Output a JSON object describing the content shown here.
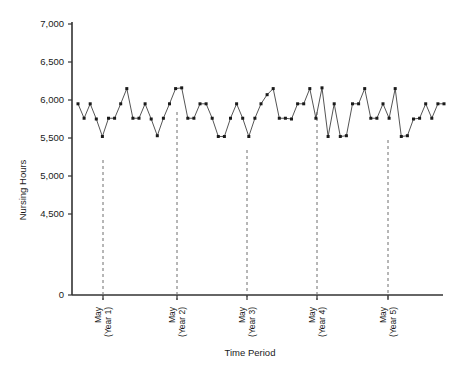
{
  "chart_data": {
    "type": "line",
    "title": "",
    "subtitle": "",
    "xlabel": "Time Period",
    "ylabel": "Nursing Hours",
    "ylim": [
      0,
      7000
    ],
    "yticks": [
      0,
      4500,
      5000,
      5500,
      6000,
      6500,
      7000
    ],
    "ytick_labels": [
      "0",
      "4,500",
      "5,000",
      "5,500",
      "6,000",
      "6,500",
      "7,000"
    ],
    "y_axis_break": true,
    "grid": false,
    "legend": null,
    "marker": "square",
    "marker_color": "#1a1a1a",
    "line_color": "#555555",
    "line_style": "solid",
    "reference_line_style": "dashed",
    "reference_line_color": "#6e6e6e",
    "xtick_labels": [
      {
        "line1": "May",
        "line2": "(Year 1)",
        "x_index": 4
      },
      {
        "line1": "May",
        "line2": "(Year 2)",
        "x_index": 16
      },
      {
        "line1": "May",
        "line2": "(Year 3)",
        "x_index": 28
      },
      {
        "line1": "May",
        "line2": "(Year 4)",
        "x_index": 40
      },
      {
        "line1": "May",
        "line2": "(Year 5)",
        "x_index": 52
      }
    ],
    "x": [
      0,
      1,
      2,
      3,
      4,
      5,
      6,
      7,
      8,
      9,
      10,
      11,
      12,
      13,
      14,
      15,
      16,
      17,
      18,
      19,
      20,
      21,
      22,
      23,
      24,
      25,
      26,
      27,
      28,
      29,
      30,
      31,
      32,
      33,
      34,
      35,
      36,
      37,
      38,
      39,
      40,
      41,
      42,
      43,
      44,
      45,
      46,
      47,
      48,
      49,
      50,
      51,
      52,
      53,
      54,
      55,
      56,
      57,
      58,
      59,
      60
    ],
    "values": [
      5950,
      5760,
      5950,
      5750,
      5520,
      5760,
      5760,
      5950,
      6150,
      5760,
      5760,
      5950,
      5750,
      5530,
      5760,
      5950,
      6150,
      6160,
      5760,
      5760,
      5950,
      5950,
      5760,
      5520,
      5520,
      5760,
      5950,
      5760,
      5520,
      5760,
      5950,
      6070,
      6150,
      5760,
      5760,
      5750,
      5950,
      5950,
      6150,
      5760,
      6160,
      5520,
      5950,
      5520,
      5530,
      5950,
      5950,
      6150,
      5760,
      5760,
      5950,
      5760,
      6150,
      5520,
      5530,
      5750,
      5760,
      5950,
      5760,
      5950,
      5950
    ],
    "series": [
      {
        "name": "Nursing Hours",
        "values": [
          5950,
          5760,
          5950,
          5750,
          5520,
          5760,
          5760,
          5950,
          6150,
          5760,
          5760,
          5950,
          5750,
          5530,
          5760,
          5950,
          6150,
          6160,
          5760,
          5760,
          5950,
          5950,
          5760,
          5520,
          5520,
          5760,
          5950,
          5760,
          5520,
          5760,
          5950,
          6070,
          6150,
          5760,
          5760,
          5750,
          5950,
          5950,
          6150,
          5760,
          6160,
          5520,
          5950,
          5520,
          5530,
          5950,
          5950,
          6150,
          5760,
          5760,
          5950,
          5760,
          6150,
          5520,
          5530,
          5750,
          5760,
          5950,
          5760,
          5950,
          5950
        ]
      }
    ],
    "annotations": [
      {
        "type": "vertical-dashed-line",
        "label": "May (Year 1)",
        "x_index": 4
      },
      {
        "type": "vertical-dashed-line",
        "label": "May (Year 2)",
        "x_index": 16
      },
      {
        "type": "vertical-dashed-line",
        "label": "May (Year 3)",
        "x_index": 28
      },
      {
        "type": "vertical-dashed-line",
        "label": "May (Year 4)",
        "x_index": 40
      },
      {
        "type": "vertical-dashed-line",
        "label": "May (Year 5)",
        "x_index": 52
      }
    ]
  },
  "axes": {
    "y_title": "Nursing Hours",
    "x_title": "Time Period",
    "y_labels": {
      "t7000": "7,000",
      "t6500": "6,500",
      "t6000": "6,000",
      "t5500": "5,500",
      "t5000": "5,000",
      "t4500": "4,500",
      "t0": "0"
    },
    "x_labels": {
      "m1_top": "May",
      "m1_bot": "(Year 1)",
      "m2_top": "May",
      "m2_bot": "(Year 2)",
      "m3_top": "May",
      "m3_bot": "(Year 3)",
      "m4_top": "May",
      "m4_bot": "(Year 4)",
      "m5_top": "May",
      "m5_bot": "(Year 5)"
    }
  },
  "colors": {
    "marker": "#1a1a1a",
    "line": "#555555",
    "axis": "#333333",
    "dashed": "#6e6e6e",
    "background": "#ffffff"
  }
}
